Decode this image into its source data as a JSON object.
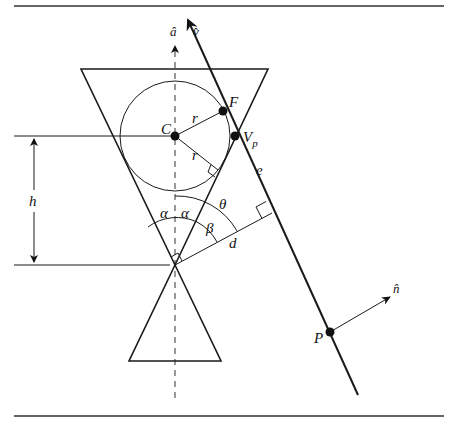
{
  "figure": {
    "labels": {
      "axis": "â",
      "ray_dir": "v̂",
      "center": "C",
      "tangent_point": "F",
      "cone_point": "V",
      "cone_point_sub": "p",
      "radius_top": "r",
      "radius_bottom": "r",
      "ray": "e",
      "height": "h",
      "alpha_left": "α",
      "alpha_right": "α",
      "theta": "θ",
      "beta": "β",
      "distance": "d",
      "point": "P",
      "normal": "n̂"
    },
    "colors": {
      "stroke": "#1a1a1a",
      "axis_dash": "#555555",
      "background": "#ffffff"
    },
    "geometry": {
      "apex": [
        175,
        265
      ],
      "sphere_center": [
        175,
        136
      ],
      "sphere_radius": 55,
      "upper_cone_base_y": 69,
      "upper_cone_base_x": [
        81,
        268
      ],
      "lower_cone_base_y": 361,
      "lower_cone_base_x": [
        129,
        221
      ],
      "ray_start": [
        188,
        20
      ],
      "ray_end": [
        358,
        395
      ],
      "point_F": [
        223,
        111
      ],
      "point_Vp": [
        235,
        136
      ],
      "perp_foot": [
        272,
        213
      ],
      "point_P": [
        330,
        332
      ],
      "normal_tip": [
        390,
        297
      ]
    }
  }
}
